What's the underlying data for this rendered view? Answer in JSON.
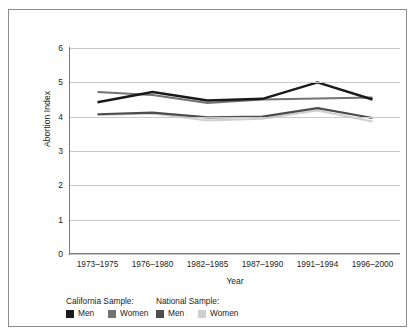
{
  "chart_data": {
    "type": "line",
    "title": "",
    "xlabel": "Year",
    "ylabel": "Abortion Index",
    "categories": [
      "1973–1975",
      "1976–1980",
      "1982–1985",
      "1987–1990",
      "1991–1994",
      "1996–2000"
    ],
    "ylim": [
      0,
      6
    ],
    "yticks": [
      0,
      1,
      2,
      3,
      4,
      5,
      6
    ],
    "grid": "horizontal",
    "legend_position": "bottom-left",
    "series": [
      {
        "name": "California Sample: Men",
        "group": "California Sample:",
        "label": "Men",
        "color": "#1a1a1a",
        "width": 2.4,
        "values": [
          4.42,
          4.72,
          4.47,
          4.52,
          5.0,
          4.5
        ]
      },
      {
        "name": "California Sample: Women",
        "group": "California Sample:",
        "label": "Women",
        "color": "#737373",
        "width": 2.0,
        "values": [
          4.72,
          4.63,
          4.4,
          4.5,
          4.53,
          4.56
        ]
      },
      {
        "name": "National Sample: Men",
        "group": "National Sample:",
        "label": "Men",
        "color": "#4d4d4d",
        "width": 2.2,
        "values": [
          4.07,
          4.12,
          3.98,
          4.0,
          4.25,
          3.96
        ]
      },
      {
        "name": "National Sample: Women",
        "group": "National Sample:",
        "label": "Women",
        "color": "#cfcfcf",
        "width": 2.0,
        "values": [
          4.05,
          4.09,
          3.89,
          3.94,
          4.18,
          3.86
        ]
      }
    ]
  },
  "legend": {
    "groups": [
      {
        "heading": "California Sample:",
        "items": [
          {
            "label": "Men",
            "color": "#1a1a1a"
          },
          {
            "label": "Women",
            "color": "#737373"
          }
        ]
      },
      {
        "heading": "National Sample:",
        "items": [
          {
            "label": "Men",
            "color": "#4d4d4d"
          },
          {
            "label": "Women",
            "color": "#cfcfcf"
          }
        ]
      }
    ]
  },
  "colors": {
    "frame_border": "#8d8d8d",
    "gridline": "#c9c9c9",
    "axis": "#7a7a7a",
    "text": "#1c1c1c",
    "background": "#ffffff"
  }
}
